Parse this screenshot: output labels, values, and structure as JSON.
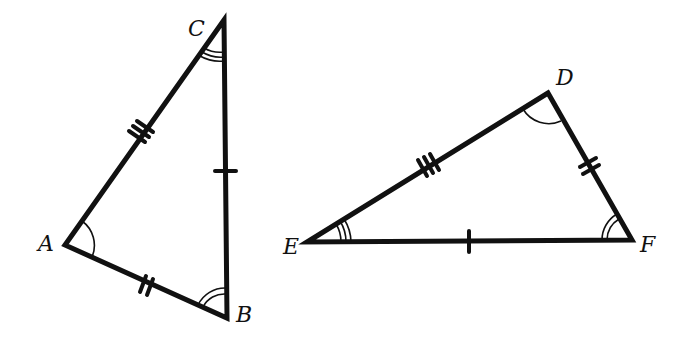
{
  "diagram": {
    "type": "congruent-triangles",
    "triangles": [
      {
        "name": "triangle-ABC",
        "vertices": {
          "A": {
            "label": "A",
            "x": 65,
            "y": 245
          },
          "B": {
            "label": "B",
            "x": 227,
            "y": 318
          },
          "C": {
            "label": "C",
            "x": 224,
            "y": 20
          }
        },
        "sides": [
          {
            "name": "AC",
            "tick_marks": 3
          },
          {
            "name": "AB",
            "tick_marks": 2
          },
          {
            "name": "BC",
            "tick_marks": 1
          }
        ],
        "angles": [
          {
            "vertex": "A",
            "arcs": 1
          },
          {
            "vertex": "B",
            "arcs": 2
          },
          {
            "vertex": "C",
            "arcs": 3
          }
        ]
      },
      {
        "name": "triangle-DEF",
        "vertices": {
          "D": {
            "label": "D",
            "x": 548,
            "y": 93
          },
          "E": {
            "label": "E",
            "x": 307,
            "y": 242
          },
          "F": {
            "label": "F",
            "x": 632,
            "y": 240
          }
        },
        "sides": [
          {
            "name": "DE",
            "tick_marks": 3
          },
          {
            "name": "DF",
            "tick_marks": 2
          },
          {
            "name": "EF",
            "tick_marks": 1
          }
        ],
        "angles": [
          {
            "vertex": "D",
            "arcs": 1
          },
          {
            "vertex": "F",
            "arcs": 2
          },
          {
            "vertex": "E",
            "arcs": 3
          }
        ]
      }
    ]
  },
  "labels": {
    "A": "A",
    "B": "B",
    "C": "C",
    "D": "D",
    "E": "E",
    "F": "F"
  },
  "colors": {
    "stroke": "#111111",
    "background": "#ffffff"
  }
}
